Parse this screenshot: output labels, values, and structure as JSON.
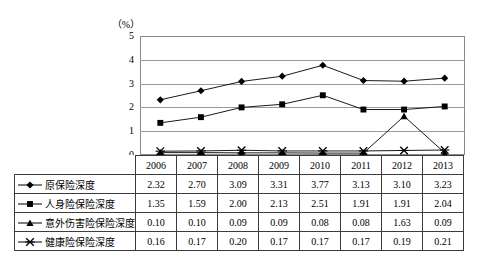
{
  "chart_data": {
    "type": "line",
    "title": "",
    "xlabel": "",
    "ylabel": "",
    "unit_label": "（%）",
    "ylim": [
      0,
      5
    ],
    "yticks": [
      0,
      1,
      2,
      3,
      4,
      5
    ],
    "grid": true,
    "legend_position": "table-left-column",
    "categories": [
      "2006",
      "2007",
      "2008",
      "2009",
      "2010",
      "2011",
      "2012",
      "2013"
    ],
    "series": [
      {
        "name": "原保险深度",
        "marker": "diamond",
        "color": "#000000",
        "values": [
          2.32,
          2.7,
          3.09,
          3.31,
          3.77,
          3.13,
          3.1,
          3.23
        ]
      },
      {
        "name": "人身险保险深度",
        "marker": "square",
        "color": "#000000",
        "values": [
          1.35,
          1.59,
          2.0,
          2.13,
          2.51,
          1.91,
          1.91,
          2.04
        ]
      },
      {
        "name": "意外伤害险保险深度",
        "marker": "triangle",
        "color": "#000000",
        "values": [
          0.1,
          0.1,
          0.09,
          0.09,
          0.08,
          0.08,
          1.63,
          0.09
        ]
      },
      {
        "name": "健康险保险深度",
        "marker": "x-cross",
        "color": "#000000",
        "values": [
          0.16,
          0.17,
          0.2,
          0.17,
          0.17,
          0.17,
          0.19,
          0.21
        ]
      }
    ]
  },
  "table": {
    "year_header": [
      "2006",
      "2007",
      "2008",
      "2009",
      "2010",
      "2011",
      "2012",
      "2013"
    ],
    "rows": [
      {
        "label": "原保险深度",
        "marker": "diamond",
        "values": [
          "2.32",
          "2.70",
          "3.09",
          "3.31",
          "3.77",
          "3.13",
          "3.10",
          "3.23"
        ]
      },
      {
        "label": "人身险保险深度",
        "marker": "square",
        "values": [
          "1.35",
          "1.59",
          "2.00",
          "2.13",
          "2.51",
          "1.91",
          "1.91",
          "2.04"
        ]
      },
      {
        "label": "意外伤害险保险深度",
        "marker": "triangle",
        "values": [
          "0.10",
          "0.10",
          "0.09",
          "0.09",
          "0.08",
          "0.08",
          "1.63",
          "0.09"
        ]
      },
      {
        "label": "健康险保险深度",
        "marker": "x-cross",
        "values": [
          "0.16",
          "0.17",
          "0.20",
          "0.17",
          "0.17",
          "0.17",
          "0.19",
          "0.21"
        ]
      }
    ]
  },
  "axis": {
    "ytick_labels": [
      "5",
      "4",
      "3",
      "2",
      "1",
      "0"
    ]
  },
  "colors": {
    "line": "#000000",
    "grid": "#9a9a9a",
    "frame": "#8a8a8a",
    "table_border": "#3c3c3c",
    "background": "#ffffff"
  }
}
